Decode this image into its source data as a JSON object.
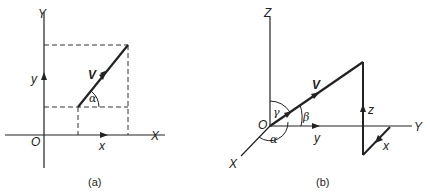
{
  "figure_a": {
    "caption": "(a)",
    "axis_x_label": "X",
    "axis_y_label": "Y",
    "origin_label": "O",
    "vector_label": "V",
    "component_x_label": "x",
    "component_y_label": "y",
    "angle_label": "α"
  },
  "figure_b": {
    "caption": "(b)",
    "axis_x_label": "X",
    "axis_y_label": "Y",
    "axis_z_label": "Z",
    "origin_label": "O",
    "vector_label": "V",
    "component_x_label": "x",
    "component_y_label": "y",
    "component_z_label": "z",
    "angle_alpha_label": "α",
    "angle_beta_label": "β",
    "angle_gamma_label": "γ"
  },
  "colors": {
    "stroke": "#222222",
    "background": "#ffffff"
  }
}
